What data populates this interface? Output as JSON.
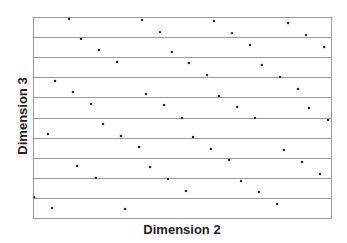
{
  "chart_data": {
    "type": "scatter",
    "title": "",
    "xlabel": "Dimension 2",
    "ylabel": "Dimension 3",
    "xlim": [
      0,
      1
    ],
    "ylim": [
      0,
      1
    ],
    "grid": {
      "horizontal_lines": 10,
      "vertical_lines": 0
    },
    "ticks_shown": false,
    "legend": null,
    "frame": {
      "left": 33,
      "top": 17,
      "right": 331,
      "bottom": 218
    },
    "colors": {
      "frame": "#9a9a9a",
      "lines": "#9a9a9a",
      "points": "#222222"
    },
    "points": [
      {
        "x": 0.121,
        "y": 0.99
      },
      {
        "x": 0.161,
        "y": 0.891
      },
      {
        "x": 0.221,
        "y": 0.836
      },
      {
        "x": 0.282,
        "y": 0.776
      },
      {
        "x": 0.074,
        "y": 0.682
      },
      {
        "x": 0.134,
        "y": 0.627
      },
      {
        "x": 0.195,
        "y": 0.567
      },
      {
        "x": 0.235,
        "y": 0.468
      },
      {
        "x": 0.295,
        "y": 0.408
      },
      {
        "x": 0.05,
        "y": 0.418
      },
      {
        "x": 0.366,
        "y": 0.985
      },
      {
        "x": 0.426,
        "y": 0.925
      },
      {
        "x": 0.607,
        "y": 0.98
      },
      {
        "x": 0.466,
        "y": 0.826
      },
      {
        "x": 0.523,
        "y": 0.771
      },
      {
        "x": 0.584,
        "y": 0.711
      },
      {
        "x": 0.379,
        "y": 0.617
      },
      {
        "x": 0.44,
        "y": 0.562
      },
      {
        "x": 0.5,
        "y": 0.498
      },
      {
        "x": 0.624,
        "y": 0.607
      },
      {
        "x": 0.537,
        "y": 0.403
      },
      {
        "x": 0.356,
        "y": 0.353
      },
      {
        "x": 0.597,
        "y": 0.343
      },
      {
        "x": 0.668,
        "y": 0.92
      },
      {
        "x": 0.856,
        "y": 0.97
      },
      {
        "x": 0.916,
        "y": 0.91
      },
      {
        "x": 0.728,
        "y": 0.861
      },
      {
        "x": 0.977,
        "y": 0.851
      },
      {
        "x": 0.768,
        "y": 0.761
      },
      {
        "x": 0.829,
        "y": 0.701
      },
      {
        "x": 0.889,
        "y": 0.642
      },
      {
        "x": 0.685,
        "y": 0.552
      },
      {
        "x": 0.926,
        "y": 0.547
      },
      {
        "x": 0.745,
        "y": 0.498
      },
      {
        "x": 0.99,
        "y": 0.488
      },
      {
        "x": 0.842,
        "y": 0.338
      },
      {
        "x": 0.148,
        "y": 0.259
      },
      {
        "x": 0.211,
        "y": 0.199
      },
      {
        "x": 0.004,
        "y": 0.104
      },
      {
        "x": 0.064,
        "y": 0.05
      },
      {
        "x": 0.309,
        "y": 0.045
      },
      {
        "x": 0.393,
        "y": 0.254
      },
      {
        "x": 0.453,
        "y": 0.194
      },
      {
        "x": 0.513,
        "y": 0.134
      },
      {
        "x": 0.658,
        "y": 0.289
      },
      {
        "x": 0.903,
        "y": 0.279
      },
      {
        "x": 0.963,
        "y": 0.219
      },
      {
        "x": 0.698,
        "y": 0.184
      },
      {
        "x": 0.758,
        "y": 0.129
      },
      {
        "x": 0.819,
        "y": 0.07
      }
    ]
  }
}
